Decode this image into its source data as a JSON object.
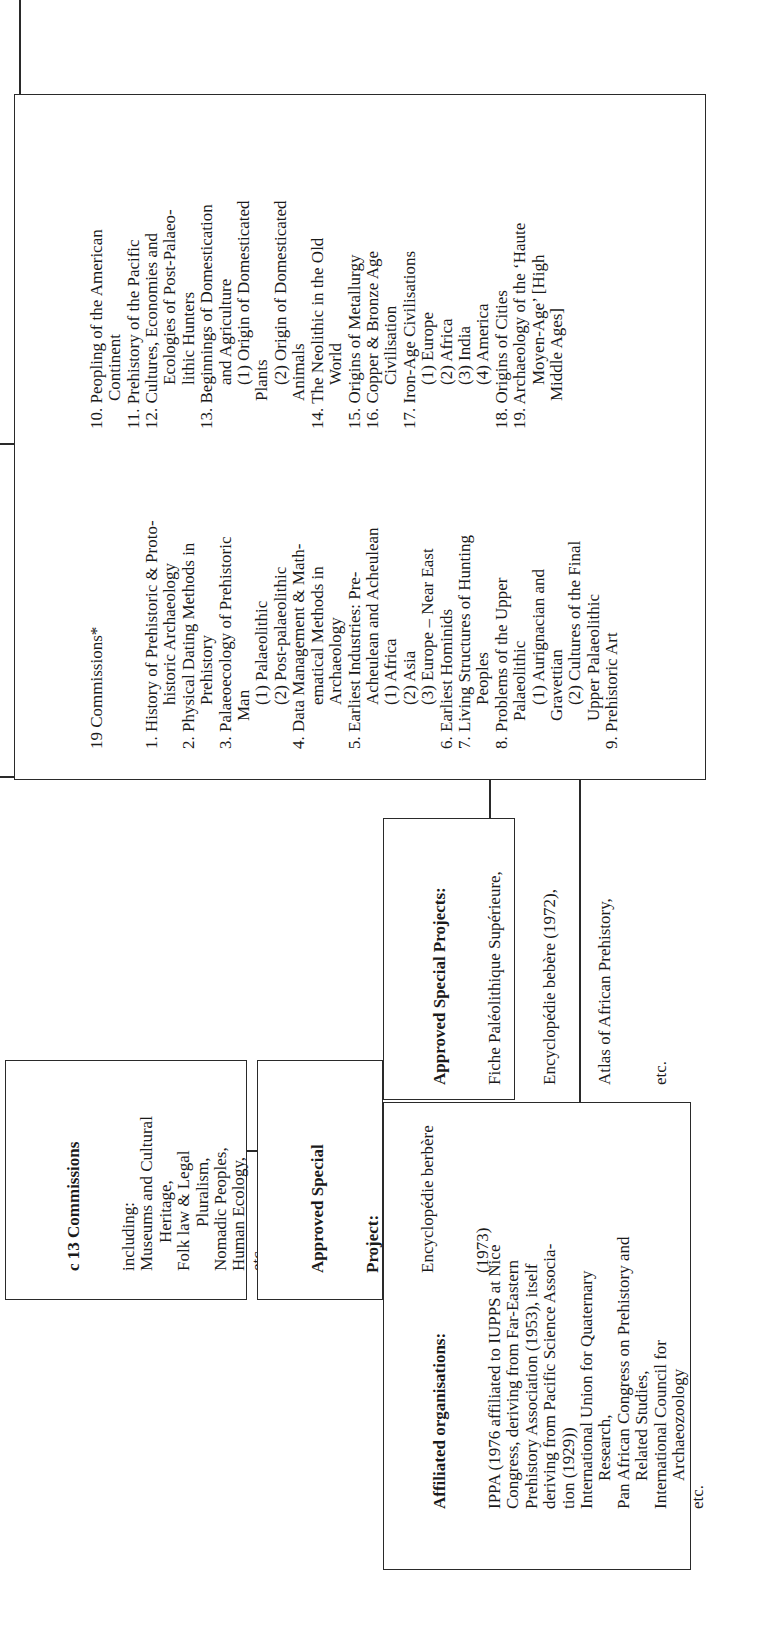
{
  "commissions_box": {
    "heading": "19 Commissions*",
    "left_column": [
      {
        "text": "1. History of Prehistoric & Proto-",
        "indent": 0
      },
      {
        "text": "historic Archaeology",
        "indent": 2
      },
      {
        "text": "2. Physical Dating Methods in",
        "indent": 0
      },
      {
        "text": "Prehistory",
        "indent": 2
      },
      {
        "text": "3. Palaeoecology of Prehistoric",
        "indent": 0
      },
      {
        "text": "Man",
        "indent": 1
      },
      {
        "text": "(1) Palaeolithic",
        "indent": 2
      },
      {
        "text": "(2) Post-palaeolithic",
        "indent": 2
      },
      {
        "text": "4. Data Management & Math-",
        "indent": 0
      },
      {
        "text": "ematical Methods in",
        "indent": 2
      },
      {
        "text": "Archaeology",
        "indent": 2
      },
      {
        "text": "5. Earliest Industries: Pre-",
        "indent": 0
      },
      {
        "text": "Acheulean and Acheulean",
        "indent": 2
      },
      {
        "text": "(1) Africa",
        "indent": 2
      },
      {
        "text": "(2) Asia",
        "indent": 2
      },
      {
        "text": "(3) Europe – Near East",
        "indent": 2
      },
      {
        "text": "6. Earliest Hominids",
        "indent": 0
      },
      {
        "text": "7. Living Structures of Hunting",
        "indent": 0
      },
      {
        "text": "Peoples",
        "indent": 2
      },
      {
        "text": "8. Problems of the Upper",
        "indent": 0
      },
      {
        "text": "Palaeolithic",
        "indent": 1
      },
      {
        "text": "(1) Aurignacian and",
        "indent": 2
      },
      {
        "text": "Gravettian",
        "indent": 1
      },
      {
        "text": "(2) Cultures of the Final",
        "indent": 2
      },
      {
        "text": "Upper Palaeolithic",
        "indent": 1
      },
      {
        "text": "9. Prehistoric Art",
        "indent": 0
      }
    ],
    "right_column": [
      {
        "text": "10. Peopling of the American",
        "indent": 0
      },
      {
        "text": "Continent",
        "indent": 1
      },
      {
        "text": "11. Prehistory of the Pacific",
        "indent": 0
      },
      {
        "text": "12. Cultures, Economies and",
        "indent": 0
      },
      {
        "text": "Ecologies of Post-Palaeo-",
        "indent": 2
      },
      {
        "text": "lithic Hunters",
        "indent": 2
      },
      {
        "text": "13. Beginnings of Domestication",
        "indent": 0
      },
      {
        "text": "and Agriculture",
        "indent": 2
      },
      {
        "text": "(1) Origin of Domesticated",
        "indent": 2
      },
      {
        "text": "Plants",
        "indent": 1
      },
      {
        "text": "(2) Origin of Domesticated",
        "indent": 2
      },
      {
        "text": "Animals",
        "indent": 1
      },
      {
        "text": "14. The Neolithic in the Old",
        "indent": 0
      },
      {
        "text": "World",
        "indent": 2
      },
      {
        "text": "15. Origins of Metallurgy",
        "indent": 0
      },
      {
        "text": "16. Copper & Bronze Age",
        "indent": 0
      },
      {
        "text": "Civilisation",
        "indent": 2
      },
      {
        "text": "17. Iron-Age Civilisations",
        "indent": 0
      },
      {
        "text": "(1) Europe",
        "indent": 2
      },
      {
        "text": "(2) Africa",
        "indent": 2
      },
      {
        "text": "(3) India",
        "indent": 2
      },
      {
        "text": "(4) America",
        "indent": 2
      },
      {
        "text": "18. Origins of Cities",
        "indent": 0
      },
      {
        "text": "19. Archaeology of the ‘Haute",
        "indent": 0
      },
      {
        "text": "Moyen-Age’ [High",
        "indent": 2
      },
      {
        "text": "Middle Ages]",
        "indent": 1
      }
    ]
  },
  "approved_special_projects": {
    "heading": "Approved Special Projects:",
    "lines": [
      "Fiche Paléolithique Supérieure,",
      "Encyclopédie bebère (1972),",
      "Atlas of African Prehistory,",
      "etc."
    ]
  },
  "affiliated_organisations": {
    "heading": "Affiliated organisations:",
    "lines": [
      {
        "text": "IPPA (1976 affiliated to IUPPS at Nice",
        "indent": 0
      },
      {
        "text": "Congress, deriving from Far-Eastern",
        "indent": 0
      },
      {
        "text": "Prehistory Association (1953), itself",
        "indent": 0
      },
      {
        "text": "deriving from Pacific Science Associa-",
        "indent": 0
      },
      {
        "text": "tion (1929))",
        "indent": 0
      },
      {
        "text": "International Union for Quaternary",
        "indent": 0
      },
      {
        "text": "Research,",
        "indent": 1
      },
      {
        "text": "Pan African Congress on Prehistory and",
        "indent": 0
      },
      {
        "text": "Related Studies,",
        "indent": 1
      },
      {
        "text": "International Council for",
        "indent": 0
      },
      {
        "text": "Archaeozoology",
        "indent": 1
      },
      {
        "text": "etc.",
        "indent": 0
      }
    ]
  },
  "c13_commissions_box": {
    "heading": "c 13 Commissions",
    "lines": [
      {
        "text": "including:",
        "indent": 0
      },
      {
        "text": "Museums and Cultural",
        "indent": 0
      },
      {
        "text": "Heritage,",
        "indent": 1
      },
      {
        "text": "Folk law & Legal",
        "indent": 0
      },
      {
        "text": "Pluralism,",
        "indent": 2
      },
      {
        "text": "Nomadic Peoples,",
        "indent": 0
      },
      {
        "text": "Human Ecology,",
        "indent": 0
      },
      {
        "text": "etc.",
        "indent": 0
      }
    ]
  },
  "approved_special_project_box": {
    "heading_line1": "Approved Special",
    "heading_line2": "Project:",
    "lines": [
      "Encyclopédie berbère",
      "(1973)"
    ]
  }
}
